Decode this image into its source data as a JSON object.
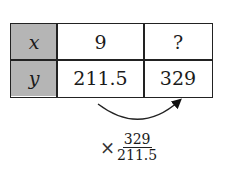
{
  "table": {
    "rows": [
      {
        "label": "x",
        "values": [
          "9",
          "?"
        ]
      },
      {
        "label": "y",
        "values": [
          "211.5",
          "329"
        ]
      }
    ],
    "header_color": "#b5b5b5"
  },
  "annotation": {
    "operator": "×",
    "numerator": "329",
    "denominator": "211.5"
  }
}
